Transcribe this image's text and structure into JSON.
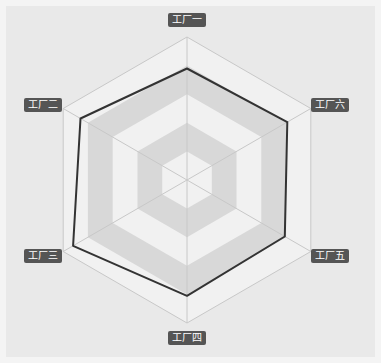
{
  "chart_data": {
    "type": "radar",
    "title": "",
    "indicators": [
      "工厂一",
      "工厂二",
      "工厂三",
      "工厂四",
      "工厂五",
      "工厂六"
    ],
    "max": 100,
    "split_number": 5,
    "series": [
      {
        "name": "",
        "values": [
          78,
          86,
          92,
          81,
          79,
          81
        ]
      }
    ],
    "legend": null,
    "colors": {
      "background": "#e9e9e9",
      "band_light": "#f1f1f1",
      "band_dark": "#d8d8d8",
      "axis_line": "#c8c8c8",
      "series_line": "#333333",
      "label_bg": "#555555",
      "label_text": "#ffffff"
    }
  },
  "labels": {
    "l0": "工厂一",
    "l1": "工厂二",
    "l2": "工厂三",
    "l3": "工厂四",
    "l4": "工厂五",
    "l5": "工厂六"
  }
}
